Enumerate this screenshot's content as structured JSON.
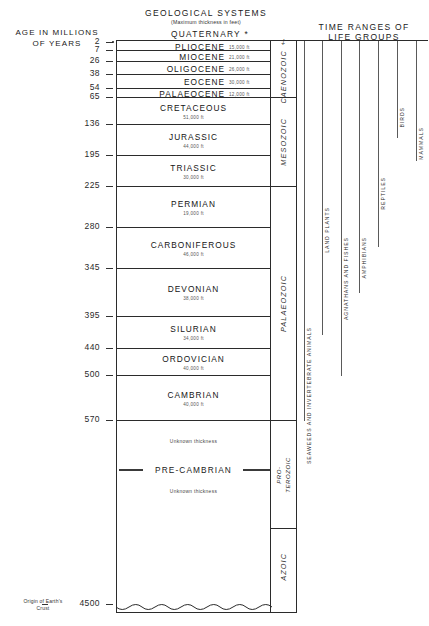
{
  "headers": {
    "age_title_line1": "AGE IN MILLIONS",
    "age_title_line2": "OF YEARS",
    "systems_title": "GEOLOGICAL  SYSTEMS",
    "systems_subtitle": "(Maximum thickness  in   feet)",
    "life_title_line1": "TIME RANGES OF",
    "life_title_line2": "LIFE GROUPS",
    "quaternary": "QUATERNARY *"
  },
  "age_scale": {
    "unit": "millions of years",
    "values": [
      2,
      7,
      26,
      38,
      54,
      65,
      136,
      195,
      225,
      280,
      345,
      395,
      440,
      500,
      570,
      4500
    ]
  },
  "origin_note": {
    "line1": "Origin of Earth's",
    "line2": "Crust",
    "age": "4500"
  },
  "chart_data": {
    "type": "table",
    "title": "GEOLOGICAL  SYSTEMS",
    "subtitle": "(Maximum thickness  in   feet)",
    "xlabel": "",
    "ylabel": "AGE IN MILLIONS OF YEARS",
    "ylim": [
      0,
      4500
    ],
    "grid": false,
    "legend_position": "right",
    "axis_ticks": [
      2,
      7,
      26,
      38,
      54,
      65,
      136,
      195,
      225,
      280,
      345,
      395,
      440,
      500,
      570,
      4500
    ],
    "systems": [
      {
        "name": "PLIOCENE",
        "thickness": "15,000 ft",
        "start": 7,
        "end": 2,
        "era": "CAENOZOIC"
      },
      {
        "name": "MIOCENE",
        "thickness": "21,000 ft",
        "start": 26,
        "end": 7,
        "era": "CAENOZOIC"
      },
      {
        "name": "OLIGOCENE",
        "thickness": "26,000 ft",
        "start": 38,
        "end": 26,
        "era": "CAENOZOIC"
      },
      {
        "name": "EOCENE",
        "thickness": "30,000 ft",
        "start": 54,
        "end": 38,
        "era": "CAENOZOIC"
      },
      {
        "name": "PALAEOCENE",
        "thickness": "12,000 ft",
        "start": 65,
        "end": 54,
        "era": "CAENOZOIC"
      },
      {
        "name": "CRETACEOUS",
        "thickness": "51,000 ft",
        "start": 136,
        "end": 65,
        "era": "MESOZOIC"
      },
      {
        "name": "JURASSIC",
        "thickness": "44,000 ft",
        "start": 195,
        "end": 136,
        "era": "MESOZOIC"
      },
      {
        "name": "TRIASSIC",
        "thickness": "30,000 ft",
        "start": 225,
        "end": 195,
        "era": "MESOZOIC"
      },
      {
        "name": "PERMIAN",
        "thickness": "19,000 ft",
        "start": 280,
        "end": 225,
        "era": "PALAEOZOIC"
      },
      {
        "name": "CARBONIFEROUS",
        "thickness": "46,000 ft",
        "start": 345,
        "end": 280,
        "era": "PALAEOZOIC"
      },
      {
        "name": "DEVONIAN",
        "thickness": "38,000 ft",
        "start": 395,
        "end": 345,
        "era": "PALAEOZOIC"
      },
      {
        "name": "SILURIAN",
        "thickness": "34,000 ft",
        "start": 440,
        "end": 395,
        "era": "PALAEOZOIC"
      },
      {
        "name": "ORDOVICIAN",
        "thickness": "40,000 ft",
        "start": 500,
        "end": 440,
        "era": "PALAEOZOIC"
      },
      {
        "name": "CAMBRIAN",
        "thickness": "40,000 ft",
        "start": 570,
        "end": 500,
        "era": "PALAEOZOIC"
      },
      {
        "name": "PRE-CAMBRIAN",
        "thickness": "Unknown thickness",
        "start": 4500,
        "end": 570,
        "era": "PRO-TEROZOIC / AZOIC"
      }
    ],
    "eras": [
      {
        "name": "CAENOZOIC ‡",
        "start": 65,
        "end": 2
      },
      {
        "name": "MESOZOIC",
        "start": 225,
        "end": 65
      },
      {
        "name": "PALAEOZOIC",
        "start": 570,
        "end": 225
      },
      {
        "name": "PRO- TEROZOIC",
        "start": 2600,
        "end": 570
      },
      {
        "name": "AZOIC",
        "start": 4500,
        "end": 2600
      }
    ],
    "life_groups": [
      {
        "name": "SEAWEEDS AND INVERTEBRATE ANIMALS",
        "first_appearance": 570,
        "extends_to": 2
      },
      {
        "name": "LAND PLANTS",
        "first_appearance": 420,
        "extends_to": 2
      },
      {
        "name": "AGNATHANS AND FISHES",
        "first_appearance": 500,
        "extends_to": 2
      },
      {
        "name": "AMPHIBIANS",
        "first_appearance": 370,
        "extends_to": 2
      },
      {
        "name": "REPTILES",
        "first_appearance": 310,
        "extends_to": 2
      },
      {
        "name": "BIRDS",
        "first_appearance": 160,
        "extends_to": 2
      },
      {
        "name": "MAMMALS",
        "first_appearance": 200,
        "extends_to": 2
      }
    ],
    "unknown_thickness_label": "Unknown thickness"
  }
}
